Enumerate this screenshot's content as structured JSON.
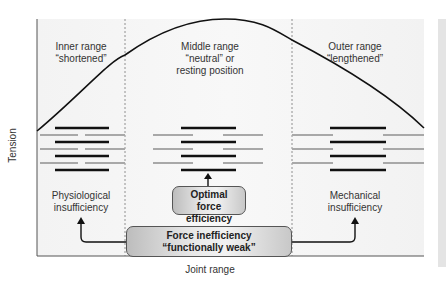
{
  "figure": {
    "regions": [
      {
        "id": "inner",
        "label_line1": "Inner range",
        "label_line2": "“shortened”"
      },
      {
        "id": "middle",
        "label_line1": "Middle range",
        "label_line2": "“neutral” or",
        "label_line3": "resting position"
      },
      {
        "id": "outer",
        "label_line1": "Outer range",
        "label_line2": "“lengthened”"
      }
    ],
    "axes": {
      "xlabel": "Joint range",
      "ylabel": "Tension"
    },
    "outcomes": {
      "left_line1": "Physiological",
      "left_line2": "insufficiency",
      "right_line1": "Mechanical",
      "right_line2": "insufficiency"
    },
    "boxes": {
      "optimal_line1": "Optimal",
      "optimal_line2": "force efficiency",
      "inefficiency_line1": "Force inefficiency",
      "inefficiency_line2": "“functionally weak”"
    },
    "colors": {
      "curve": "#111111",
      "myosin_bar": "#111111",
      "actin_bar": "#a8a8a8",
      "plot_bg": "#f5f5f5",
      "box_border": "#555555"
    }
  }
}
